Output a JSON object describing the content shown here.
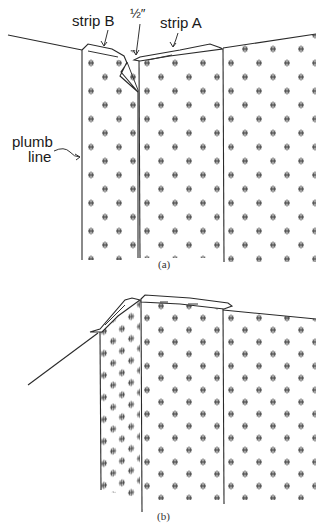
{
  "figure": {
    "panel_a": {
      "caption": "(a)",
      "labels": {
        "strip_b": "strip B",
        "half_inch": "½″",
        "strip_a": "strip A",
        "plumb_line_1": "plumb",
        "plumb_line_2": "line"
      }
    },
    "panel_b": {
      "caption": "(b)"
    }
  }
}
